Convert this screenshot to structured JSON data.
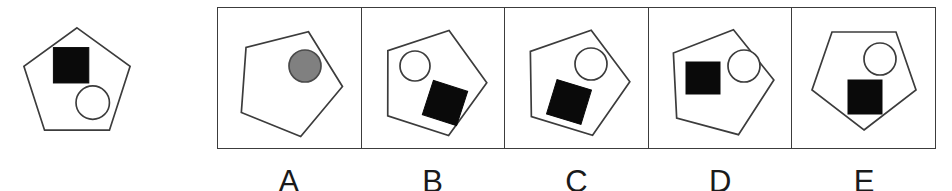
{
  "item": {
    "type": "figural-analogy",
    "stroke_color": "#3c3c3c",
    "fill_black": "#0a0a0a",
    "fill_white": "#ffffff",
    "fill_gray": "#808080",
    "background": "#ffffff"
  },
  "stem": {
    "name": "stem-figure",
    "outer_shape": "pentagon",
    "rotation_deg": 0,
    "orientation": "point-up",
    "contents": [
      {
        "shape": "square",
        "fill": "black",
        "position": "upper-left"
      },
      {
        "shape": "circle",
        "fill": "white",
        "position": "lower-right"
      }
    ]
  },
  "options": [
    {
      "label": "A",
      "outer_shape": "pentagon",
      "rotation_deg": 22,
      "contents": [
        {
          "shape": "circle",
          "fill": "gray",
          "position": "upper-right"
        }
      ]
    },
    {
      "label": "B",
      "outer_shape": "pentagon",
      "rotation_deg": 18,
      "contents": [
        {
          "shape": "circle",
          "fill": "white",
          "position": "upper-left"
        },
        {
          "shape": "square",
          "fill": "black",
          "position": "lower-right"
        }
      ]
    },
    {
      "label": "C",
      "outer_shape": "pentagon",
      "rotation_deg": 17,
      "contents": [
        {
          "shape": "circle",
          "fill": "white",
          "position": "upper-right"
        },
        {
          "shape": "square",
          "fill": "black",
          "position": "lower-left"
        }
      ]
    },
    {
      "label": "D",
      "outer_shape": "pentagon",
      "rotation_deg": 15,
      "contents": [
        {
          "shape": "square",
          "fill": "black",
          "position": "left"
        },
        {
          "shape": "circle",
          "fill": "white",
          "position": "upper-right"
        }
      ]
    },
    {
      "label": "E",
      "outer_shape": "pentagon",
      "rotation_deg": 180,
      "orientation": "point-down",
      "contents": [
        {
          "shape": "circle",
          "fill": "white",
          "position": "upper-right"
        },
        {
          "shape": "square",
          "fill": "black",
          "position": "center"
        }
      ]
    }
  ]
}
